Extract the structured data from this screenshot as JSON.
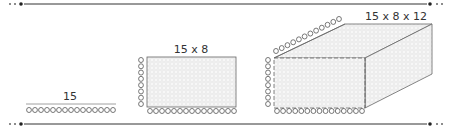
{
  "diagram": {
    "colors": {
      "line": "#222222",
      "edge": "#666666",
      "fill": "#f2f2f2",
      "dots": "#e0e0e0",
      "text": "#333333"
    },
    "vector": {
      "label": "15",
      "count": 15
    },
    "matrix": {
      "label": "15 x 8",
      "cols": 15,
      "rows": 8
    },
    "tensor": {
      "label": "15 x 8 x 12",
      "cols": 15,
      "rows": 8,
      "depth": 12
    },
    "borders": {
      "top": "decorative-divider",
      "bottom": "decorative-divider"
    }
  }
}
